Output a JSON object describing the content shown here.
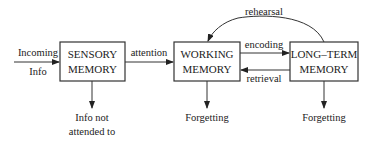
{
  "diagram": {
    "type": "flowchart",
    "title": "",
    "boxes": {
      "sensory": {
        "line1": "SENSORY",
        "line2": "MEMORY"
      },
      "working": {
        "line1": "WORKING",
        "line2": "MEMORY"
      },
      "longterm": {
        "line1": "LONG–TERM",
        "line2": "MEMORY"
      }
    },
    "labels": {
      "incoming_line1": "Incoming",
      "incoming_line2": "Info",
      "attention": "attention",
      "encoding": "encoding",
      "retrieval": "retrieval",
      "rehearsal": "rehearsal",
      "not_attended_line1": "Info not",
      "not_attended_line2": "attended to",
      "forgetting_working": "Forgetting",
      "forgetting_longterm": "Forgetting"
    },
    "edges": [
      {
        "from": "Incoming Info",
        "to": "SENSORY MEMORY",
        "label": ""
      },
      {
        "from": "SENSORY MEMORY",
        "to": "WORKING MEMORY",
        "label": "attention"
      },
      {
        "from": "WORKING MEMORY",
        "to": "LONG-TERM MEMORY",
        "label": "encoding"
      },
      {
        "from": "LONG-TERM MEMORY",
        "to": "WORKING MEMORY",
        "label": "retrieval"
      },
      {
        "from": "LONG-TERM MEMORY",
        "to": "WORKING MEMORY",
        "label": "rehearsal"
      },
      {
        "from": "SENSORY MEMORY",
        "to": "Info not attended to",
        "label": ""
      },
      {
        "from": "WORKING MEMORY",
        "to": "Forgetting",
        "label": ""
      },
      {
        "from": "LONG-TERM MEMORY",
        "to": "Forgetting",
        "label": ""
      }
    ]
  }
}
